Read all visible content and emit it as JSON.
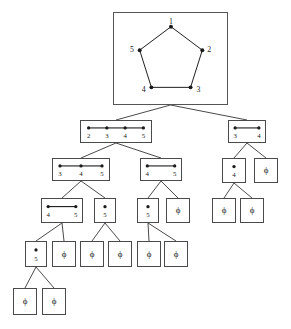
{
  "figure": {
    "type": "recursion-tree-diagram",
    "width": 291,
    "height": 329,
    "background": "#ffffff",
    "line_color": "#4a4a4a",
    "text_color": "#1a1a1a",
    "empty_symbol": "ϕ"
  },
  "root_graph": {
    "name": "pentagon-c5",
    "vertex_labels": [
      "1",
      "2",
      "3",
      "4",
      "5"
    ],
    "vertices": [
      {
        "label": "1",
        "x": 171,
        "y": 26,
        "label_x": 171,
        "label_y": 21
      },
      {
        "label": "2",
        "x": 203,
        "y": 50,
        "label_x": 210,
        "label_y": 50
      },
      {
        "label": "3",
        "x": 191,
        "y": 88,
        "label_x": 199,
        "label_y": 91
      },
      {
        "label": "4",
        "x": 151,
        "y": 88,
        "label_x": 143,
        "label_y": 91
      },
      {
        "label": "5",
        "x": 139,
        "y": 50,
        "label_x": 131,
        "label_y": 50
      }
    ],
    "edges": [
      [
        "1",
        "2"
      ],
      [
        "2",
        "3"
      ],
      [
        "3",
        "4"
      ],
      [
        "4",
        "5"
      ],
      [
        "5",
        "1"
      ]
    ]
  },
  "nodes": [
    {
      "id": "n0",
      "name": "root-pentagon-node",
      "level": 0,
      "box": {
        "x": 113,
        "y": 12,
        "w": 115,
        "h": 93
      },
      "kind": "graph",
      "labels": [
        "1",
        "2",
        "3",
        "4",
        "5"
      ]
    },
    {
      "id": "n1",
      "name": "path-2345-node",
      "level": 1,
      "box": {
        "x": 80,
        "y": 120,
        "w": 72,
        "h": 23
      },
      "kind": "path",
      "labels": [
        "2",
        "3",
        "4",
        "5"
      ]
    },
    {
      "id": "n2",
      "name": "edge-34-node",
      "level": 1,
      "box": {
        "x": 228,
        "y": 120,
        "w": 38,
        "h": 23
      },
      "kind": "path",
      "labels": [
        "3",
        "4"
      ]
    },
    {
      "id": "n3",
      "name": "path-345-node",
      "level": 2,
      "box": {
        "x": 52,
        "y": 158,
        "w": 58,
        "h": 23
      },
      "kind": "path",
      "labels": [
        "3",
        "4",
        "5"
      ]
    },
    {
      "id": "n4",
      "name": "edge-45-node",
      "level": 2,
      "box": {
        "x": 140,
        "y": 158,
        "w": 42,
        "h": 23
      },
      "kind": "path",
      "labels": [
        "4",
        "5"
      ]
    },
    {
      "id": "n5",
      "name": "single-4-node",
      "level": 2,
      "box": {
        "x": 222,
        "y": 158,
        "w": 24,
        "h": 25
      },
      "kind": "path",
      "labels": [
        "4"
      ]
    },
    {
      "id": "n6",
      "name": "empty-node-a",
      "level": 2,
      "box": {
        "x": 254,
        "y": 158,
        "w": 24,
        "h": 25
      },
      "kind": "empty",
      "labels": []
    },
    {
      "id": "n7",
      "name": "edge-45-node-2",
      "level": 3,
      "box": {
        "x": 41,
        "y": 198,
        "w": 42,
        "h": 25
      },
      "kind": "path",
      "labels": [
        "4",
        "5"
      ]
    },
    {
      "id": "n8",
      "name": "single-5-node-a",
      "level": 3,
      "box": {
        "x": 94,
        "y": 198,
        "w": 22,
        "h": 25
      },
      "kind": "path",
      "labels": [
        "5"
      ]
    },
    {
      "id": "n9",
      "name": "single-5-node-b",
      "level": 3,
      "box": {
        "x": 137,
        "y": 198,
        "w": 22,
        "h": 25
      },
      "kind": "path",
      "labels": [
        "5"
      ]
    },
    {
      "id": "n10",
      "name": "empty-node-b",
      "level": 3,
      "box": {
        "x": 166,
        "y": 198,
        "w": 24,
        "h": 25
      },
      "kind": "empty",
      "labels": []
    },
    {
      "id": "n11",
      "name": "empty-node-c",
      "level": 3,
      "box": {
        "x": 212,
        "y": 198,
        "w": 24,
        "h": 25
      },
      "kind": "empty",
      "labels": []
    },
    {
      "id": "n12",
      "name": "empty-node-d",
      "level": 3,
      "box": {
        "x": 240,
        "y": 198,
        "w": 24,
        "h": 25
      },
      "kind": "empty",
      "labels": []
    },
    {
      "id": "n13",
      "name": "single-5-node-c",
      "level": 4,
      "box": {
        "x": 25,
        "y": 241,
        "w": 22,
        "h": 26
      },
      "kind": "path",
      "labels": [
        "5"
      ]
    },
    {
      "id": "n14",
      "name": "empty-node-e",
      "level": 4,
      "box": {
        "x": 52,
        "y": 241,
        "w": 24,
        "h": 26
      },
      "kind": "empty",
      "labels": []
    },
    {
      "id": "n15",
      "name": "empty-node-f",
      "level": 4,
      "box": {
        "x": 80,
        "y": 241,
        "w": 24,
        "h": 26
      },
      "kind": "empty",
      "labels": []
    },
    {
      "id": "n16",
      "name": "empty-node-g",
      "level": 4,
      "box": {
        "x": 108,
        "y": 241,
        "w": 24,
        "h": 26
      },
      "kind": "empty",
      "labels": []
    },
    {
      "id": "n17",
      "name": "empty-node-h",
      "level": 4,
      "box": {
        "x": 137,
        "y": 241,
        "w": 24,
        "h": 26
      },
      "kind": "empty",
      "labels": []
    },
    {
      "id": "n18",
      "name": "empty-node-i",
      "level": 4,
      "box": {
        "x": 164,
        "y": 241,
        "w": 24,
        "h": 26
      },
      "kind": "empty",
      "labels": []
    },
    {
      "id": "n19",
      "name": "empty-node-j",
      "level": 5,
      "box": {
        "x": 13,
        "y": 288,
        "w": 24,
        "h": 27
      },
      "kind": "empty",
      "labels": []
    },
    {
      "id": "n20",
      "name": "empty-node-k",
      "level": 5,
      "box": {
        "x": 42,
        "y": 288,
        "w": 24,
        "h": 27
      },
      "kind": "empty",
      "labels": []
    }
  ],
  "links": [
    {
      "from": "n0",
      "to": "n1"
    },
    {
      "from": "n0",
      "to": "n2"
    },
    {
      "from": "n1",
      "to": "n3"
    },
    {
      "from": "n1",
      "to": "n4"
    },
    {
      "from": "n2",
      "to": "n5"
    },
    {
      "from": "n2",
      "to": "n6"
    },
    {
      "from": "n3",
      "to": "n7"
    },
    {
      "from": "n3",
      "to": "n8"
    },
    {
      "from": "n4",
      "to": "n9"
    },
    {
      "from": "n4",
      "to": "n10"
    },
    {
      "from": "n5",
      "to": "n11"
    },
    {
      "from": "n5",
      "to": "n12"
    },
    {
      "from": "n7",
      "to": "n13"
    },
    {
      "from": "n7",
      "to": "n14"
    },
    {
      "from": "n8",
      "to": "n15"
    },
    {
      "from": "n8",
      "to": "n16"
    },
    {
      "from": "n9",
      "to": "n17"
    },
    {
      "from": "n9",
      "to": "n18"
    },
    {
      "from": "n13",
      "to": "n19"
    },
    {
      "from": "n13",
      "to": "n20"
    }
  ]
}
